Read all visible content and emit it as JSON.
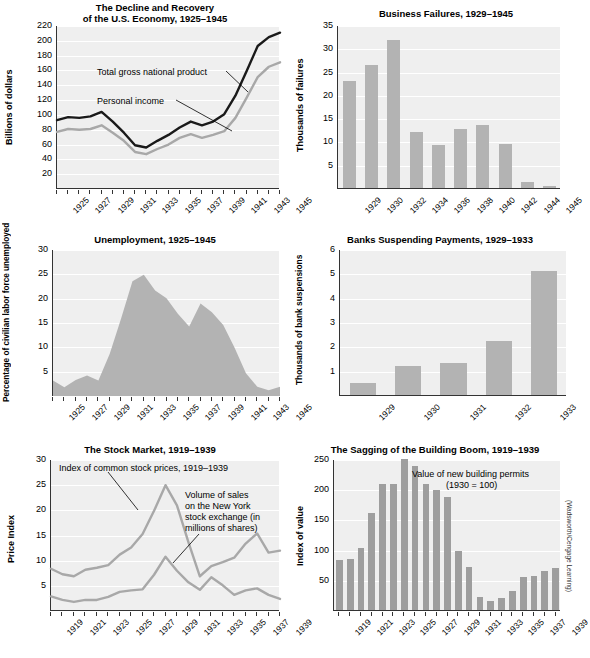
{
  "figure": {
    "credit": "(Wadsworth/Cengage Learning)"
  },
  "charts": [
    {
      "id": "decline-recovery",
      "title_line1": "The Decline and Recovery",
      "title_line2": "of the U.S. Economy, 1925–1945",
      "ylabel": "Billions of dollars",
      "annotations": [
        "Total gross national product",
        "Personal income"
      ]
    },
    {
      "id": "business-failures",
      "title_line1": "Business Failures, 1929–1945",
      "title_line2": "",
      "ylabel": "Thousands of failures",
      "annotations": []
    },
    {
      "id": "unemployment",
      "title_line1": "Unemployment, 1925–1945",
      "title_line2": "",
      "ylabel": "Percentage of civilian labor force unemployed",
      "annotations": []
    },
    {
      "id": "bank-suspensions",
      "title_line1": "Banks Suspending Payments, 1929–1933",
      "title_line2": "",
      "ylabel": "Thousands of bank suspensions",
      "annotations": []
    },
    {
      "id": "stock-market",
      "title_line1": "The Stock Market, 1919–1939",
      "title_line2": "",
      "ylabel": "Price Index",
      "annotations": [
        "Index of common stock prices, 1919–1939",
        "Volume of sales",
        "on the New York",
        "stock exchange (in",
        "millions of shares)"
      ]
    },
    {
      "id": "building-boom",
      "title_line1": "The Sagging of the Building Boom, 1919–1939",
      "title_line2": "",
      "ylabel": "Index of value",
      "annotations": [
        "Value of new building permits",
        "(1930 = 100)"
      ]
    }
  ],
  "chart_data": [
    {
      "type": "line",
      "id": "decline-recovery",
      "title": "The Decline and Recovery of the U.S. Economy, 1925–1945",
      "xlabel": "",
      "ylabel": "Billions of dollars",
      "ylim": [
        0,
        220
      ],
      "yticks": [
        20,
        40,
        60,
        80,
        100,
        120,
        140,
        160,
        180,
        200,
        220
      ],
      "grid": true,
      "x": [
        1925,
        1926,
        1927,
        1928,
        1929,
        1930,
        1931,
        1932,
        1933,
        1934,
        1935,
        1936,
        1937,
        1938,
        1939,
        1940,
        1941,
        1942,
        1943,
        1944,
        1945
      ],
      "xtick_labels": [
        "1925",
        "1927",
        "1929",
        "1931",
        "1933",
        "1935",
        "1937",
        "1939",
        "1941",
        "1943",
        "1945"
      ],
      "series": [
        {
          "name": "Total gross national product",
          "color": "#1a1a1a",
          "values": [
            93,
            97,
            96,
            98,
            104,
            91,
            76,
            59,
            56,
            65,
            73,
            83,
            91,
            86,
            91,
            101,
            126,
            159,
            193,
            205,
            211
          ]
        },
        {
          "name": "Personal income",
          "color": "#a8a8a8",
          "values": [
            77,
            81,
            80,
            81,
            86,
            76,
            65,
            50,
            47,
            54,
            60,
            69,
            74,
            69,
            73,
            78,
            96,
            123,
            151,
            165,
            171
          ]
        }
      ]
    },
    {
      "type": "bar",
      "id": "business-failures",
      "title": "Business Failures, 1929–1945",
      "xlabel": "",
      "ylabel": "Thousands of failures",
      "ylim": [
        0,
        35
      ],
      "yticks": [
        5,
        10,
        15,
        20,
        25,
        30,
        35
      ],
      "grid": true,
      "bar_color": "#b3b3b3",
      "categories": [
        "1929",
        "1930",
        "1932",
        "1934",
        "1936",
        "1938",
        "1940",
        "1942",
        "1944",
        "1945"
      ],
      "values": [
        23.0,
        26.4,
        31.8,
        12.0,
        9.3,
        12.6,
        13.6,
        9.4,
        1.2,
        0.5
      ]
    },
    {
      "type": "area",
      "id": "unemployment",
      "title": "Unemployment, 1925–1945",
      "xlabel": "",
      "ylabel": "Percentage of civilian labor force unemployed",
      "ylim": [
        0,
        30
      ],
      "yticks": [
        5,
        10,
        15,
        20,
        25,
        30
      ],
      "grid": true,
      "fill_color": "#b3b3b3",
      "x": [
        1925,
        1926,
        1927,
        1928,
        1929,
        1930,
        1931,
        1932,
        1933,
        1934,
        1935,
        1936,
        1937,
        1938,
        1939,
        1940,
        1941,
        1942,
        1943,
        1944,
        1945
      ],
      "xtick_labels": [
        "1925",
        "1927",
        "1929",
        "1931",
        "1933",
        "1935",
        "1937",
        "1939",
        "1941",
        "1943",
        "1945"
      ],
      "values": [
        3.2,
        1.8,
        3.3,
        4.2,
        3.2,
        8.7,
        15.9,
        23.6,
        24.9,
        21.7,
        20.1,
        16.9,
        14.3,
        19.0,
        17.2,
        14.6,
        9.9,
        4.7,
        1.9,
        1.2,
        1.9
      ]
    },
    {
      "type": "bar",
      "id": "bank-suspensions",
      "title": "Banks Suspending Payments, 1929–1933",
      "xlabel": "",
      "ylabel": "Thousands of bank suspensions",
      "ylim": [
        0,
        6
      ],
      "yticks": [
        1,
        2,
        3,
        4,
        5,
        6
      ],
      "grid": true,
      "bar_color": "#b3b3b3",
      "categories": [
        "1929",
        "1930",
        "1931",
        "1932",
        "1933"
      ],
      "values": [
        0.5,
        1.2,
        1.3,
        2.2,
        5.1
      ]
    },
    {
      "type": "line",
      "id": "stock-market",
      "title": "The Stock Market, 1919–1939",
      "xlabel": "",
      "ylabel": "Price Index",
      "ylim": [
        0,
        30
      ],
      "yticks": [
        5,
        10,
        15,
        20,
        25,
        30
      ],
      "grid": true,
      "x": [
        1919,
        1920,
        1921,
        1922,
        1923,
        1924,
        1925,
        1926,
        1927,
        1928,
        1929,
        1930,
        1931,
        1932,
        1933,
        1934,
        1935,
        1936,
        1937,
        1938,
        1939
      ],
      "xtick_labels": [
        "1919",
        "1921",
        "1923",
        "1925",
        "1927",
        "1929",
        "1931",
        "1933",
        "1935",
        "1937",
        "1939"
      ],
      "series": [
        {
          "name": "Index of common stock prices, 1919–1939",
          "color": "#a8a8a8",
          "values": [
            8.4,
            7.3,
            6.9,
            8.2,
            8.6,
            9.1,
            11.2,
            12.6,
            15.3,
            19.9,
            25.0,
            21.0,
            13.7,
            6.9,
            8.9,
            9.7,
            10.6,
            13.4,
            15.4,
            11.6,
            12.0
          ]
        },
        {
          "name": "Volume of sales on the New York stock exchange (in millions of shares)",
          "color": "#a8a8a8",
          "values": [
            2.9,
            2.2,
            1.8,
            2.2,
            2.2,
            2.8,
            3.8,
            4.1,
            4.3,
            7.2,
            10.8,
            8.0,
            5.7,
            4.2,
            6.7,
            5.1,
            3.2,
            4.1,
            4.5,
            3.2,
            2.4
          ]
        }
      ]
    },
    {
      "type": "bar",
      "id": "building-boom",
      "title": "The Sagging of the Building Boom, 1919–1939",
      "xlabel": "",
      "ylabel": "Index of value",
      "ylim": [
        0,
        250
      ],
      "yticks": [
        50,
        100,
        150,
        200,
        250
      ],
      "grid": true,
      "bar_color": "#9e9e9e",
      "categories": [
        "1919",
        "1920",
        "1921",
        "1922",
        "1923",
        "1924",
        "1925",
        "1926",
        "1927",
        "1928",
        "1929",
        "1930",
        "1931",
        "1932",
        "1933",
        "1934",
        "1935",
        "1936",
        "1937",
        "1938",
        "1939"
      ],
      "xtick_labels": [
        "1919",
        "1921",
        "1923",
        "1925",
        "1927",
        "1929",
        "1931",
        "1933",
        "1935",
        "1937",
        "1939"
      ],
      "values": [
        83,
        85,
        102,
        160,
        208,
        209,
        250,
        238,
        209,
        199,
        187,
        97,
        72,
        22,
        15,
        20,
        31,
        54,
        57,
        64,
        69
      ]
    }
  ]
}
